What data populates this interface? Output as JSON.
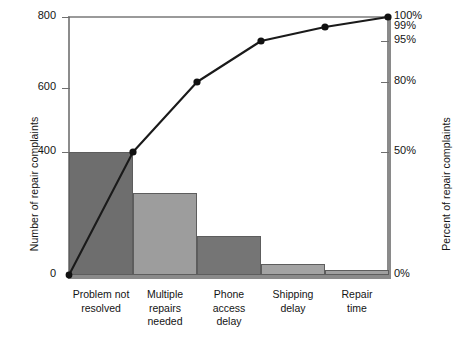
{
  "chart_data": {
    "type": "bar",
    "title": "",
    "xlabel": "",
    "ylabel": "Number of repair complaints",
    "ylabel_secondary": "Percent of repair complaints",
    "categories": [
      "Problem not resolved",
      "Multiple repairs needed",
      "Phone access delay",
      "Shipping delay",
      "Repair time"
    ],
    "category_lines": [
      [
        "Problem not",
        "resolved"
      ],
      [
        "Multiple",
        "repairs",
        "needed"
      ],
      [
        "Phone",
        "access",
        "delay"
      ],
      [
        "Shipping",
        "delay"
      ],
      [
        "Repair",
        "time"
      ]
    ],
    "values": [
      400,
      256,
      120,
      34,
      15
    ],
    "cumulative_percent": [
      50,
      80,
      95,
      99,
      100
    ],
    "ylim": [
      0,
      800
    ],
    "ylim_secondary": [
      0,
      100
    ],
    "yticks": [
      0,
      400,
      600,
      800
    ],
    "ytick_labels": [
      "0",
      "400",
      "600",
      "800"
    ],
    "yticks_secondary": [
      0,
      50,
      80,
      95,
      99,
      100
    ],
    "ytick_labels_secondary": [
      "0%",
      "50%",
      "80%",
      "95%",
      "99%",
      "100%"
    ],
    "grid": false,
    "legend": "none",
    "bar_colors": [
      "#6e6e6e",
      "#9d9d9d",
      "#757575",
      "#a3a3a3",
      "#9f9f9f"
    ],
    "line_color": "#1a1a1a",
    "marker_color": "#111111"
  },
  "axes": {
    "left_title": "Number of repair complaints",
    "right_title": "Percent of repair complaints"
  },
  "ticks": {
    "left": [
      {
        "label": "800",
        "y": 17
      },
      {
        "label": "600",
        "y": 88
      },
      {
        "label": "400",
        "y": 152
      },
      {
        "label": "0",
        "y": 275
      }
    ],
    "right": [
      {
        "label": "100%",
        "y": 17
      },
      {
        "label": "99%",
        "y": 27
      },
      {
        "label": "95%",
        "y": 41
      },
      {
        "label": "80%",
        "y": 82
      },
      {
        "label": "50%",
        "y": 152
      },
      {
        "label": "0%",
        "y": 275
      }
    ]
  },
  "bars": [
    {
      "name": "problem-not-resolved",
      "x": 69,
      "width": 64,
      "top": 152,
      "height": 123,
      "color": "#6e6e6e",
      "value": 400
    },
    {
      "name": "multiple-repairs-needed",
      "x": 133,
      "width": 64,
      "top": 193,
      "height": 82,
      "color": "#9d9d9d",
      "value": 256
    },
    {
      "name": "phone-access-delay",
      "x": 197,
      "width": 64,
      "top": 236,
      "height": 39,
      "color": "#757575",
      "value": 120
    },
    {
      "name": "shipping-delay",
      "x": 261,
      "width": 64,
      "top": 264,
      "height": 11,
      "color": "#a3a3a3",
      "value": 34
    },
    {
      "name": "repair-time",
      "x": 325,
      "width": 64,
      "top": 270,
      "height": 5,
      "color": "#9f9f9f",
      "value": 15
    }
  ],
  "line_points": [
    {
      "x": 69,
      "y": 275,
      "label": "0%"
    },
    {
      "x": 133,
      "y": 152,
      "label": "50%"
    },
    {
      "x": 197,
      "y": 82,
      "label": "80%"
    },
    {
      "x": 261,
      "y": 41,
      "label": "95%"
    },
    {
      "x": 325,
      "y": 27,
      "label": "99%"
    },
    {
      "x": 388,
      "y": 17,
      "label": "100%"
    }
  ],
  "category_label_positions": [
    {
      "left": 69,
      "width": 64
    },
    {
      "left": 133,
      "width": 64
    },
    {
      "left": 197,
      "width": 64
    },
    {
      "left": 261,
      "width": 64
    },
    {
      "left": 325,
      "width": 64
    }
  ]
}
